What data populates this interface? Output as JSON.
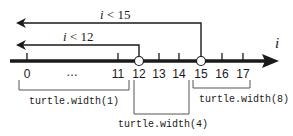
{
  "axis": {
    "label": "i",
    "ticks": [
      {
        "label": "0",
        "value": 0
      },
      {
        "label": "…",
        "value": null
      },
      {
        "label": "11",
        "value": 11
      },
      {
        "label": "12",
        "value": 12
      },
      {
        "label": "13",
        "value": 13
      },
      {
        "label": "14",
        "value": 14
      },
      {
        "label": "15",
        "value": 15
      },
      {
        "label": "16",
        "value": 16
      },
      {
        "label": "17",
        "value": 17
      }
    ],
    "open_points": [
      12,
      15
    ]
  },
  "conditions": [
    {
      "label": "i < 15",
      "var": "i",
      "op": " < ",
      "bound": "15"
    },
    {
      "label": "i < 12",
      "var": "i",
      "op": " < ",
      "bound": "12"
    }
  ],
  "ranges": [
    {
      "label": "turtle.width(1)",
      "from": 0,
      "to": 11
    },
    {
      "label": "turtle.width(4)",
      "from": 12,
      "to": 14
    },
    {
      "label": "turtle.width(8)",
      "from": 15,
      "to": 17
    }
  ],
  "colors": {
    "ink": "#1a1a1a",
    "background": "#ffffff"
  }
}
